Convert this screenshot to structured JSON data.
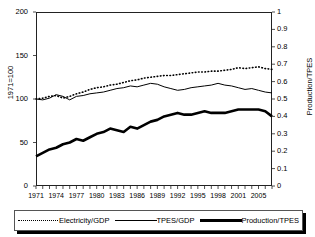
{
  "chart_data": {
    "type": "line",
    "title": "",
    "xlabel": "",
    "ylabel": "1971=100",
    "y2label": "Production/TPES",
    "ylim": [
      0,
      200
    ],
    "y2lim": [
      0,
      1
    ],
    "xlim": [
      1971,
      2006
    ],
    "grid": false,
    "legend_position": "bottom",
    "yticks": [
      "0",
      "50",
      "100",
      "150",
      "200"
    ],
    "y2ticks": [
      "0",
      "0.1",
      "0.2",
      "0.3",
      "0.4",
      "0.5",
      "0.6",
      "0.7",
      "0.8",
      "0.9",
      "1"
    ],
    "xticklabels": [
      "1971",
      "1974",
      "1977",
      "1980",
      "1983",
      "1986",
      "1989",
      "1992",
      "1995",
      "1998",
      "2001",
      "2005"
    ],
    "x": [
      1971,
      1972,
      1973,
      1974,
      1975,
      1976,
      1977,
      1978,
      1979,
      1980,
      1981,
      1982,
      1983,
      1984,
      1985,
      1986,
      1987,
      1988,
      1989,
      1990,
      1991,
      1992,
      1993,
      1994,
      1995,
      1996,
      1997,
      1998,
      1999,
      2000,
      2001,
      2002,
      2003,
      2004,
      2005,
      2006
    ],
    "series": [
      {
        "name": "Electricity/GDP",
        "style": "dotted",
        "axis": "left",
        "values": [
          100,
          101,
          103,
          104,
          101,
          103,
          106,
          108,
          111,
          113,
          114,
          116,
          117,
          119,
          121,
          122,
          124,
          125,
          126,
          127,
          127,
          128,
          129,
          130,
          131,
          131,
          132,
          132,
          133,
          134,
          136,
          135,
          136,
          137,
          135,
          134
        ]
      },
      {
        "name": "TPES/GDP",
        "style": "thin-solid",
        "axis": "left",
        "values": [
          100,
          99,
          101,
          105,
          103,
          99,
          103,
          104,
          106,
          107,
          108,
          110,
          112,
          113,
          115,
          114,
          116,
          118,
          117,
          114,
          112,
          110,
          111,
          113,
          114,
          115,
          116,
          118,
          116,
          115,
          113,
          111,
          112,
          110,
          108,
          107
        ]
      },
      {
        "name": "Production/TPES",
        "style": "thick-solid",
        "axis": "right",
        "values": [
          0.17,
          0.19,
          0.21,
          0.22,
          0.24,
          0.25,
          0.27,
          0.26,
          0.28,
          0.3,
          0.31,
          0.33,
          0.32,
          0.31,
          0.34,
          0.33,
          0.35,
          0.37,
          0.38,
          0.4,
          0.41,
          0.42,
          0.41,
          0.41,
          0.42,
          0.43,
          0.42,
          0.42,
          0.42,
          0.43,
          0.44,
          0.44,
          0.44,
          0.44,
          0.43,
          0.4
        ]
      }
    ]
  },
  "legend": {
    "items": [
      {
        "label": "Electricity/GDP",
        "style": "dotted"
      },
      {
        "label": "TPES/GDP",
        "style": "thin-solid"
      },
      {
        "label": "Production/TPES",
        "style": "thick-solid"
      }
    ]
  }
}
